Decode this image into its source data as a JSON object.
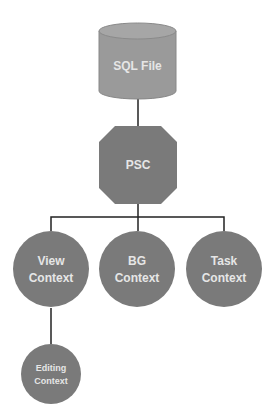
{
  "colors": {
    "node_fill": "#7a7a7a",
    "cylinder_fill": "#9a9a9a",
    "cylinder_top": "#a8a8a8",
    "edge": "#222222",
    "label": "#e6e6e6"
  },
  "nodes": {
    "sql_file": {
      "label": "SQL File",
      "shape": "cylinder"
    },
    "psc": {
      "label": "PSC",
      "shape": "octagon"
    },
    "view_context": {
      "line1": "View",
      "line2": "Context",
      "shape": "circle"
    },
    "bg_context": {
      "line1": "BG",
      "line2": "Context",
      "shape": "circle"
    },
    "task_context": {
      "line1": "Task",
      "line2": "Context",
      "shape": "circle"
    },
    "editing_context": {
      "line1": "Editing",
      "line2": "Context",
      "shape": "circle"
    }
  },
  "edges": [
    {
      "from": "SQL File",
      "to": "PSC"
    },
    {
      "from": "PSC",
      "to": "View Context"
    },
    {
      "from": "PSC",
      "to": "BG Context"
    },
    {
      "from": "PSC",
      "to": "Task Context"
    },
    {
      "from": "View Context",
      "to": "Editing Context"
    }
  ]
}
